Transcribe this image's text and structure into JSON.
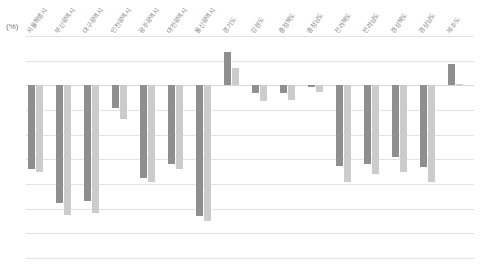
{
  "chart_data": {
    "type": "bar",
    "title": "",
    "subtitle": "",
    "xlabel": "",
    "ylabel": "(%)",
    "unit_label": "(%)",
    "ylim": [
      -35,
      10
    ],
    "yticks": [
      10,
      5,
      0,
      -5,
      -10,
      -15,
      -20,
      -25,
      -30,
      -35
    ],
    "ytick_labels": [
      "10",
      "5",
      "0",
      "-5",
      "-10",
      "-15",
      "-20",
      "-25",
      "-30",
      "-35"
    ],
    "grid": true,
    "legend": "none",
    "categories": [
      "서울특별시",
      "부산광역시",
      "대구광역시",
      "인천광역시",
      "광주광역시",
      "대전광역시",
      "울산광역시",
      "경기도",
      "강원도",
      "충청북도",
      "충청남도",
      "전라북도",
      "전라남도",
      "경상북도",
      "경상남도",
      "제주도"
    ],
    "series": [
      {
        "name": "series-1",
        "color": "#8f8f8f",
        "values": [
          -17.0,
          -23.8,
          -23.5,
          -4.5,
          -18.8,
          -16.0,
          -26.5,
          6.8,
          -1.6,
          -1.6,
          -0.3,
          -16.3,
          -16.0,
          -14.5,
          -16.5,
          4.4
        ]
      },
      {
        "name": "series-2",
        "color": "#cccccc",
        "values": [
          -17.6,
          -26.2,
          -25.8,
          -6.8,
          -19.5,
          -17.0,
          -27.5,
          3.6,
          -3.2,
          -3.0,
          -1.4,
          -19.5,
          -18.0,
          -17.6,
          -19.5,
          0.3
        ]
      }
    ]
  }
}
